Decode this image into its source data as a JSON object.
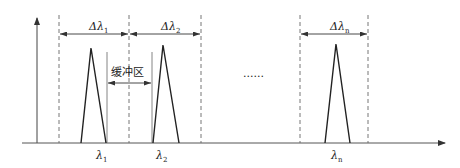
{
  "diagram": {
    "type": "wavelength-channel-spacing",
    "colors": {
      "line": "#333333",
      "dashed": "#666666",
      "background": "#ffffff"
    },
    "channels": [
      {
        "id": "1",
        "width_label": "Δλ",
        "width_sub": "1",
        "center_label": "λ",
        "center_sub": "1"
      },
      {
        "id": "2",
        "width_label": "Δλ",
        "width_sub": "2",
        "center_label": "λ",
        "center_sub": "2"
      },
      {
        "id": "n",
        "width_label": "Δλ",
        "width_sub": "n",
        "center_label": "λ",
        "center_sub": "n"
      }
    ],
    "buffer_label": "缓冲区",
    "ellipsis": "......"
  }
}
